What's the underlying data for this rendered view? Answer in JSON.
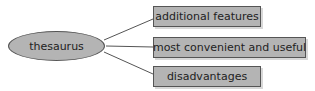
{
  "diagram": {
    "center": {
      "label": "thesaurus"
    },
    "branches": [
      {
        "label": "additional features"
      },
      {
        "label": "most convenient and useful"
      },
      {
        "label": "disadvantages"
      }
    ],
    "colors": {
      "fill": "#b4b4b4",
      "stroke": "#555555",
      "text": "#222222"
    }
  }
}
